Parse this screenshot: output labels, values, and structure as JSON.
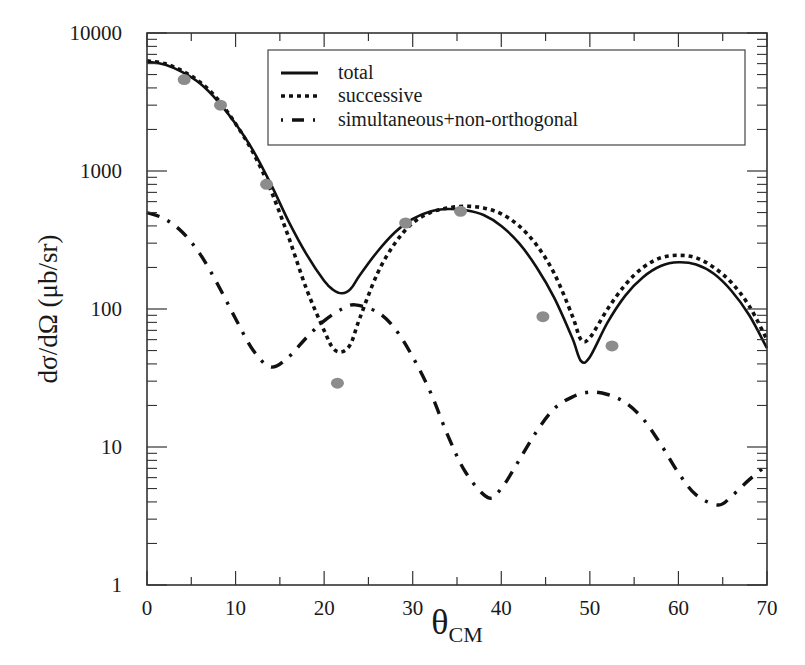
{
  "chart_data": {
    "type": "line",
    "title": "",
    "xlabel": "θ",
    "xlabel_subscript": "CM",
    "ylabel": "dσ/dΩ (μb/sr)",
    "xlim": [
      0,
      70
    ],
    "ylim": [
      1,
      10000
    ],
    "yscale": "log",
    "grid": false,
    "legend_position": "upper right",
    "x_ticks": [
      0,
      10,
      20,
      30,
      40,
      50,
      60,
      70
    ],
    "x_tick_labels": [
      "0",
      "10",
      "20",
      "30",
      "40",
      "50",
      "60",
      "70"
    ],
    "y_ticks": [
      1,
      10,
      100,
      1000,
      10000
    ],
    "y_tick_labels": [
      "1",
      "10",
      "100",
      "1000",
      "10000"
    ],
    "series": [
      {
        "name": "total",
        "style": "solid",
        "x": [
          0,
          2,
          4,
          6,
          8,
          10,
          12,
          14,
          16,
          18,
          20,
          21,
          22,
          23,
          24,
          26,
          28,
          30,
          32,
          34,
          36,
          38,
          40,
          42,
          44,
          46,
          48,
          49,
          50,
          52,
          54,
          56,
          58,
          60,
          62,
          64,
          66,
          68,
          70
        ],
        "y": [
          6200,
          5900,
          5200,
          4300,
          3200,
          2200,
          1400,
          800,
          430,
          250,
          160,
          138,
          130,
          140,
          175,
          260,
          360,
          450,
          510,
          530,
          520,
          480,
          400,
          300,
          200,
          120,
          62,
          42,
          45,
          80,
          125,
          170,
          205,
          218,
          210,
          180,
          135,
          90,
          52
        ]
      },
      {
        "name": "successive",
        "style": "dotted",
        "x": [
          0,
          2,
          4,
          6,
          8,
          10,
          12,
          14,
          16,
          18,
          20,
          21,
          22,
          23,
          24,
          26,
          28,
          30,
          32,
          34,
          36,
          38,
          40,
          42,
          44,
          46,
          48,
          49,
          50,
          52,
          54,
          56,
          58,
          60,
          62,
          64,
          66,
          68,
          70
        ],
        "y": [
          6300,
          6000,
          5300,
          4400,
          3300,
          2200,
          1350,
          720,
          330,
          140,
          70,
          52,
          49,
          56,
          85,
          180,
          300,
          420,
          500,
          540,
          555,
          540,
          490,
          400,
          290,
          180,
          90,
          60,
          62,
          100,
          150,
          200,
          235,
          245,
          235,
          200,
          155,
          105,
          60
        ]
      },
      {
        "name": "simultaneous+non-orthogonal",
        "style": "dashdot",
        "x": [
          0,
          2,
          4,
          6,
          8,
          10,
          12,
          14,
          16,
          18,
          20,
          22,
          23.5,
          26,
          28,
          30,
          32,
          34,
          36,
          38.5,
          40,
          42,
          44,
          46,
          48,
          50,
          52,
          54,
          56,
          58,
          60,
          62,
          64.5,
          66,
          68,
          70
        ],
        "y": [
          500,
          450,
          360,
          250,
          150,
          85,
          50,
          38,
          45,
          62,
          82,
          100,
          107,
          95,
          72,
          45,
          25,
          12,
          6.5,
          4.3,
          5.0,
          8.0,
          13,
          19,
          23,
          25,
          24,
          21,
          16,
          10.5,
          6.5,
          4.5,
          3.8,
          4.4,
          5.8,
          7.4
        ]
      },
      {
        "name": "data",
        "style": "markers",
        "x": [
          4.2,
          8.3,
          13.5,
          21.5,
          29.2,
          35.4,
          44.7,
          52.5
        ],
        "y": [
          4600,
          3000,
          800,
          29,
          420,
          510,
          88,
          54
        ]
      }
    ]
  },
  "legend": {
    "items": [
      {
        "label": "total",
        "style": "solid"
      },
      {
        "label": "successive",
        "style": "dotted"
      },
      {
        "label": "simultaneous+non-orthogonal",
        "style": "dashdot"
      }
    ]
  },
  "colors": {
    "curve": "#111111",
    "marker": "#8c8c8c",
    "axis": "#333333"
  }
}
